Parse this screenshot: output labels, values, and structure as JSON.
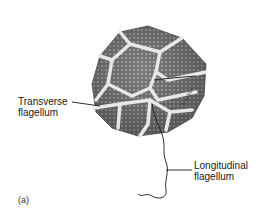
{
  "figure": {
    "panel_label": "(a)",
    "labels": {
      "transverse": [
        "Transverse",
        "flagellum"
      ],
      "longitudinal": [
        "Longitudinal",
        "flagellum"
      ]
    },
    "artist_signature": "Iverson",
    "colors": {
      "background": "#ffffff",
      "plate_fill": "#8a8a8a",
      "plate_dark": "#5e5e5e",
      "suture": "#e6e6e6",
      "line": "#1a1a1a"
    }
  }
}
